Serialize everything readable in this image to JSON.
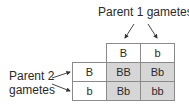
{
  "labels": {
    "parent1": "Parent 1 gametes",
    "parent2_line1": "Parent 2",
    "parent2_line2": "gametes"
  },
  "columns": [
    "B",
    "b"
  ],
  "rows": [
    "B",
    "b"
  ],
  "cells": [
    [
      "BB",
      "Bb"
    ],
    [
      "Bb",
      "bb"
    ]
  ],
  "colors": {
    "offspring_fill": "#d6d6d6",
    "border": "#8a8a8a"
  }
}
